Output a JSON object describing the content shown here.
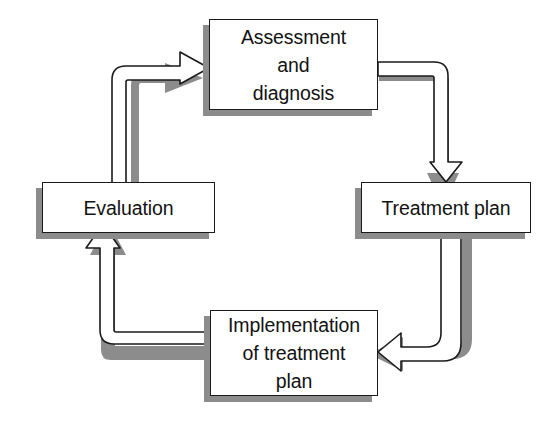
{
  "diagram": {
    "type": "cycle-flowchart",
    "orientation": "clockwise",
    "background_color": "#ffffff",
    "box_fill_color": "#ffffff",
    "box_border_color": "#1a1a1a",
    "shadow_color": "#8c8c8c",
    "arrow_fill_color": "#ffffff",
    "arrow_outline_color": "#1a1a1a",
    "text_color": "#121212",
    "nodes": [
      {
        "id": "assessment",
        "label": "Assessment\nand\ndiagnosis",
        "lines": [
          "Assessment",
          "and",
          "diagnosis"
        ],
        "position": "top"
      },
      {
        "id": "treatment",
        "label": "Treatment plan",
        "lines": [
          "Treatment plan"
        ],
        "position": "right"
      },
      {
        "id": "implementation",
        "label": "Implementation\nof treatment\nplan",
        "lines": [
          "Implementation",
          "of treatment",
          "plan"
        ],
        "position": "bottom"
      },
      {
        "id": "evaluation",
        "label": "Evaluation",
        "lines": [
          "Evaluation"
        ],
        "position": "left"
      }
    ],
    "edges": [
      {
        "id": "assessment-to-treatment",
        "from": "assessment",
        "to": "treatment",
        "direction": "down"
      },
      {
        "id": "treatment-to-implementation",
        "from": "treatment",
        "to": "implementation",
        "direction": "left"
      },
      {
        "id": "implementation-to-evaluation",
        "from": "implementation",
        "to": "evaluation",
        "direction": "up"
      },
      {
        "id": "evaluation-to-assessment",
        "from": "evaluation",
        "to": "assessment",
        "direction": "right"
      }
    ]
  }
}
